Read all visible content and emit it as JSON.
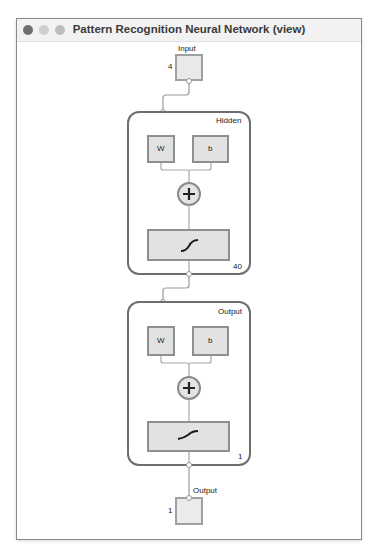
{
  "window": {
    "title": "Pattern Recognition Neural Network (view)",
    "controls": [
      "close",
      "minimize",
      "maximize"
    ]
  },
  "diagram": {
    "input": {
      "label": "Input",
      "size": "4"
    },
    "layers": [
      {
        "name": "Hidden",
        "weight_label": "W",
        "bias_label": "b",
        "sum_symbol": "+",
        "activation": "sigmoid-curve",
        "size": "40"
      },
      {
        "name": "Output",
        "weight_label": "W",
        "bias_label": "b",
        "sum_symbol": "+",
        "activation": "softmax-curve",
        "size": "1"
      }
    ],
    "output": {
      "label": "Output",
      "size": "1"
    }
  },
  "colors": {
    "block_fill": "#e6e6e6",
    "block_border": "#8f8f8f",
    "layer_border": "#6e6e6e",
    "wire": "#9a9a9a"
  }
}
